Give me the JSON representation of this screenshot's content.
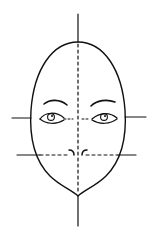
{
  "diagram": {
    "title": "Face proportion guide",
    "colors": {
      "line": "#111111",
      "background": "#ffffff"
    },
    "elements": [
      {
        "id": "center-line",
        "label": "Vertical center guide"
      },
      {
        "id": "eye-line",
        "label": "Eye-level guide"
      },
      {
        "id": "nose-line",
        "label": "Nose-level guide"
      },
      {
        "id": "head-outline",
        "label": "Egg-shaped head outline"
      },
      {
        "id": "left-eye",
        "label": "Left eye"
      },
      {
        "id": "right-eye",
        "label": "Right eye"
      },
      {
        "id": "left-eyebrow",
        "label": "Left eyebrow"
      },
      {
        "id": "right-eyebrow",
        "label": "Right eyebrow"
      },
      {
        "id": "nose",
        "label": "Nose"
      }
    ]
  }
}
